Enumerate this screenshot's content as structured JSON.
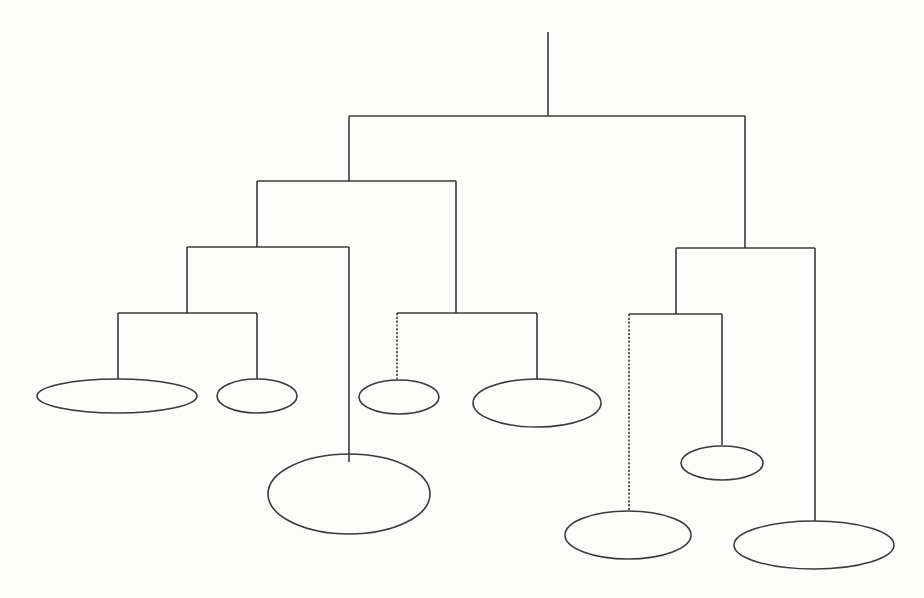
{
  "figure": {
    "stroke_color": "#3a3a3a",
    "background_color": "#fdfdfc",
    "background_note": "faint illegible bleed-through text from reverse side of scanned page"
  },
  "tree": {
    "root_stem": {
      "x": 548,
      "y1": 32,
      "y2": 116
    },
    "connectors": [
      {
        "id": "h-root",
        "x1": 349,
        "x2": 745,
        "y": 116
      },
      {
        "id": "v-left",
        "x": 349,
        "y1": 116,
        "y2": 181
      },
      {
        "id": "v-right",
        "x": 745,
        "y1": 116,
        "y2": 248
      },
      {
        "id": "h-left",
        "x1": 257,
        "x2": 456,
        "y": 181
      },
      {
        "id": "v-left-a",
        "x": 257,
        "y1": 181,
        "y2": 247
      },
      {
        "id": "v-left-b",
        "x": 456,
        "y1": 181,
        "y2": 313
      },
      {
        "id": "h-left-a",
        "x1": 187,
        "x2": 349,
        "y": 247
      },
      {
        "id": "v-left-a1",
        "x": 187,
        "y1": 247,
        "y2": 313
      },
      {
        "id": "v-left-a2",
        "x": 349,
        "y1": 247,
        "y2": 462
      },
      {
        "id": "h-left-a1",
        "x1": 118,
        "x2": 257,
        "y": 313
      },
      {
        "id": "v-leaf-1",
        "x": 118,
        "y1": 313,
        "y2": 379
      },
      {
        "id": "v-leaf-2",
        "x": 257,
        "y1": 313,
        "y2": 379
      },
      {
        "id": "h-left-b",
        "x1": 397,
        "x2": 537,
        "y": 313
      },
      {
        "id": "v-leaf-3",
        "x": 397,
        "y1": 313,
        "y2": 379,
        "dashed": true
      },
      {
        "id": "v-leaf-4",
        "x": 537,
        "y1": 313,
        "y2": 380
      },
      {
        "id": "h-right",
        "x1": 676,
        "x2": 815,
        "y": 248
      },
      {
        "id": "v-right-a",
        "x": 676,
        "y1": 248,
        "y2": 314
      },
      {
        "id": "v-right-b",
        "x": 815,
        "y1": 248,
        "y2": 521
      },
      {
        "id": "h-right-a",
        "x1": 629,
        "x2": 722,
        "y": 314
      },
      {
        "id": "v-leaf-6",
        "x": 629,
        "y1": 314,
        "y2": 511,
        "dashed": true
      },
      {
        "id": "v-leaf-7",
        "x": 722,
        "y1": 314,
        "y2": 445
      }
    ],
    "leaves": [
      {
        "id": "leaf-1",
        "cx": 117,
        "cy": 396,
        "rx": 80,
        "ry": 17
      },
      {
        "id": "leaf-2",
        "cx": 257,
        "cy": 396,
        "rx": 40,
        "ry": 17
      },
      {
        "id": "leaf-3",
        "cx": 399,
        "cy": 397,
        "rx": 40,
        "ry": 17
      },
      {
        "id": "leaf-4",
        "cx": 537,
        "cy": 403,
        "rx": 64,
        "ry": 24
      },
      {
        "id": "leaf-5",
        "cx": 349,
        "cy": 494,
        "rx": 81,
        "ry": 40
      },
      {
        "id": "leaf-6",
        "cx": 628,
        "cy": 535,
        "rx": 63,
        "ry": 24
      },
      {
        "id": "leaf-7",
        "cx": 722,
        "cy": 463,
        "rx": 41,
        "ry": 17
      },
      {
        "id": "leaf-8",
        "cx": 814,
        "cy": 545,
        "rx": 80,
        "ry": 24
      }
    ]
  }
}
